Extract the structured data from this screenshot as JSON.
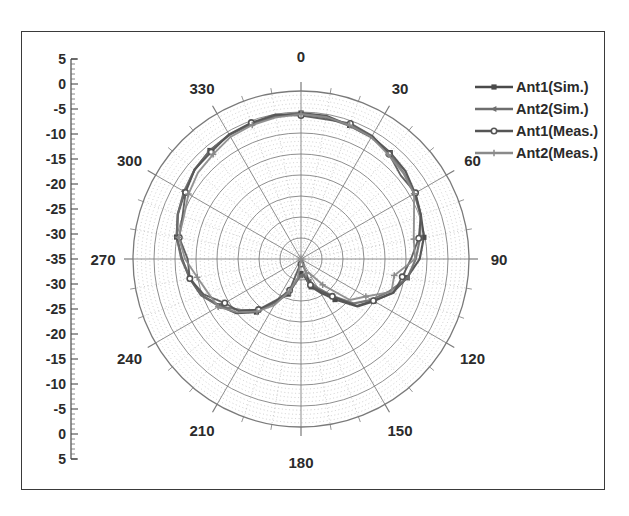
{
  "chart_data": {
    "type": "line",
    "title": "",
    "plot_kind": "polar-radiation-pattern",
    "xlabel": "Angle (degrees)",
    "ylabel": "Gain (dB)",
    "grid": true,
    "legend_position": "top-right",
    "angular_axis": {
      "unit": "degrees",
      "zero_at": "top",
      "direction": "clockwise",
      "major_step": 30,
      "minor_step": 10,
      "tick_labels": [
        "0",
        "30",
        "60",
        "90",
        "120",
        "150",
        "180",
        "210",
        "240",
        "270",
        "300",
        "330"
      ]
    },
    "radial_axis": {
      "unit": "dB",
      "outer_value": 5,
      "center_value": -35,
      "major_step": 5,
      "minor_step": 1,
      "tick_labels_top_to_center": [
        "5",
        "0",
        "-5",
        "-10",
        "-15",
        "-20",
        "-25",
        "-30",
        "-35"
      ],
      "tick_labels_center_to_bottom": [
        "-30",
        "-25",
        "-20",
        "-15",
        "-10",
        "-5",
        "0",
        "5"
      ],
      "ruler_labels": [
        "5",
        "0",
        "-5",
        "-10",
        "-15",
        "-20",
        "-25",
        "-30",
        "-35",
        "-30",
        "-25",
        "-20",
        "-15",
        "-10",
        "-5",
        "0",
        "5"
      ]
    },
    "series": [
      {
        "name": "Ant1(Sim.)",
        "marker": "square",
        "color": "#4a4a4a",
        "angles": [
          0,
          10,
          20,
          30,
          40,
          50,
          60,
          70,
          80,
          90,
          100,
          110,
          120,
          130,
          140,
          150,
          160,
          170,
          180,
          190,
          200,
          210,
          220,
          230,
          240,
          250,
          260,
          270,
          280,
          290,
          300,
          310,
          320,
          330,
          340,
          350
        ],
        "values": [
          -0.4,
          -0.6,
          -1.0,
          -1.4,
          -2.0,
          -2.6,
          -3.4,
          -4.4,
          -5.6,
          -7.0,
          -9.0,
          -11.5,
          -14.5,
          -18.0,
          -22.0,
          -26.0,
          -28.5,
          -30.5,
          -31.5,
          -29.5,
          -26.5,
          -23.0,
          -19.0,
          -15.5,
          -12.5,
          -10.0,
          -8.0,
          -6.4,
          -5.0,
          -3.8,
          -2.8,
          -2.0,
          -1.4,
          -0.9,
          -0.6,
          -0.4
        ]
      },
      {
        "name": "Ant2(Sim.)",
        "marker": "triangle-left",
        "color": "#6e6e6e",
        "angles": [
          0,
          10,
          20,
          30,
          40,
          50,
          60,
          70,
          80,
          90,
          100,
          110,
          120,
          130,
          140,
          150,
          160,
          170,
          180,
          190,
          200,
          210,
          220,
          230,
          240,
          250,
          260,
          270,
          280,
          290,
          300,
          310,
          320,
          330,
          340,
          350
        ],
        "values": [
          -0.5,
          -0.7,
          -1.1,
          -1.6,
          -2.2,
          -2.9,
          -3.7,
          -4.8,
          -6.1,
          -7.6,
          -9.6,
          -12.2,
          -15.2,
          -18.8,
          -22.8,
          -26.6,
          -29.2,
          -31.2,
          -32.2,
          -30.2,
          -27.0,
          -23.4,
          -19.4,
          -15.8,
          -12.8,
          -10.3,
          -8.3,
          -6.7,
          -5.3,
          -4.1,
          -3.1,
          -2.2,
          -1.5,
          -1.0,
          -0.7,
          -0.5
        ]
      },
      {
        "name": "Ant1(Meas.)",
        "marker": "circle",
        "color": "#555555",
        "angles": [
          0,
          10,
          20,
          30,
          40,
          50,
          60,
          70,
          80,
          90,
          100,
          110,
          120,
          130,
          140,
          150,
          160,
          170,
          180,
          190,
          200,
          210,
          220,
          230,
          240,
          250,
          260,
          270,
          280,
          290,
          300,
          310,
          320,
          330,
          340,
          350
        ],
        "values": [
          -0.6,
          -0.9,
          -1.3,
          -1.8,
          -2.4,
          -3.2,
          -4.1,
          -5.2,
          -6.6,
          -8.2,
          -10.4,
          -13.0,
          -16.2,
          -20.0,
          -24.0,
          -27.5,
          -30.0,
          -32.5,
          -33.5,
          -31.0,
          -27.5,
          -24.0,
          -20.0,
          -16.4,
          -13.2,
          -10.8,
          -8.8,
          -7.1,
          -5.7,
          -4.4,
          -3.3,
          -2.4,
          -1.7,
          -1.2,
          -0.8,
          -0.6
        ]
      },
      {
        "name": "Ant2(Meas.)",
        "marker": "plus",
        "color": "#8a8a8a",
        "angles": [
          0,
          10,
          20,
          30,
          40,
          50,
          60,
          70,
          80,
          90,
          100,
          110,
          120,
          130,
          140,
          150,
          160,
          170,
          180,
          190,
          200,
          210,
          220,
          230,
          240,
          250,
          260,
          270,
          280,
          290,
          300,
          310,
          320,
          330,
          340,
          350
        ],
        "values": [
          -0.7,
          -1.0,
          -1.4,
          -2.0,
          -2.7,
          -3.5,
          -4.5,
          -5.7,
          -7.2,
          -8.9,
          -11.2,
          -13.9,
          -17.2,
          -21.0,
          -25.0,
          -28.6,
          -31.0,
          -33.4,
          -34.2,
          -31.8,
          -28.2,
          -24.6,
          -20.6,
          -17.0,
          -13.7,
          -11.2,
          -9.2,
          -7.5,
          -6.0,
          -4.7,
          -3.6,
          -2.6,
          -1.9,
          -1.3,
          -0.9,
          -0.7
        ]
      }
    ]
  },
  "legend": {
    "entries": [
      {
        "label": "Ant1(Sim.)"
      },
      {
        "label": "Ant2(Sim.)"
      },
      {
        "label": "Ant1(Meas.)"
      },
      {
        "label": "Ant2(Meas.)"
      }
    ]
  },
  "colors": {
    "frame": "#3a3a3a",
    "grid_major": "#7a7a7a",
    "grid_minor": "#b9b9b9",
    "text": "#2b2b2b",
    "background": "#ffffff"
  }
}
